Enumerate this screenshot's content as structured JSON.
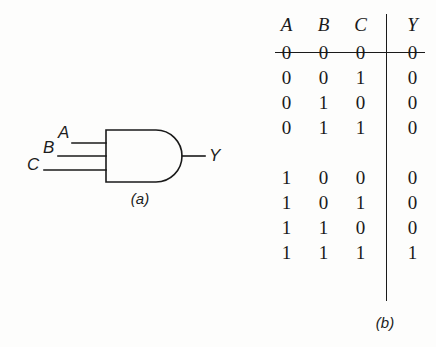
{
  "figure": {
    "kind": "logic-gate-with-truth-table",
    "background_color": "#fdfdfc",
    "ink_color": "#1a1a1a"
  },
  "gate": {
    "type": "AND",
    "input_count": 3,
    "inputs": [
      {
        "label": "A"
      },
      {
        "label": "B"
      },
      {
        "label": "C"
      }
    ],
    "output": {
      "label": "Y"
    },
    "caption": "(a)"
  },
  "truth_table": {
    "caption": "(b)",
    "input_headers": [
      "A",
      "B",
      "C"
    ],
    "output_header": "Y",
    "rows": [
      {
        "inputs": [
          "0",
          "0",
          "0"
        ],
        "output": "0"
      },
      {
        "inputs": [
          "0",
          "0",
          "1"
        ],
        "output": "0"
      },
      {
        "inputs": [
          "0",
          "1",
          "0"
        ],
        "output": "0"
      },
      {
        "inputs": [
          "0",
          "1",
          "1"
        ],
        "output": "0"
      },
      {
        "inputs": [
          "1",
          "0",
          "0"
        ],
        "output": "0"
      },
      {
        "inputs": [
          "1",
          "0",
          "1"
        ],
        "output": "0"
      },
      {
        "inputs": [
          "1",
          "1",
          "0"
        ],
        "output": "0"
      },
      {
        "inputs": [
          "1",
          "1",
          "1"
        ],
        "output": "1"
      }
    ],
    "group_break_after_row": 4
  }
}
